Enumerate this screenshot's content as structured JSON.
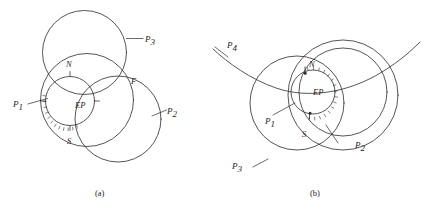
{
  "figure": {
    "background": "#ffffff",
    "ink_color": "#2b2b2b",
    "panels": [
      {
        "id": "a",
        "caption": "(a)",
        "labels": {
          "p1": "P",
          "p1_sub": "1",
          "p2": "P",
          "p2_sub": "2",
          "p3": "P",
          "p3_sub": "3",
          "north": "N",
          "south": "S",
          "focus": "F",
          "ep": "EP"
        },
        "description": "Three intersecting circles P1, P2, P3 with a small hatched exit-pupil circle EP at the center; N marks the north tick, S the south tick, F the upper intersection point."
      },
      {
        "id": "b",
        "caption": "(b)",
        "labels": {
          "p1": "P",
          "p1_sub": "1",
          "p2": "P",
          "p2_sub": "2",
          "p3": "P",
          "p3_sub": "3",
          "p4": "P",
          "p4_sub": "4",
          "north": "N",
          "south": "S",
          "ep": "EP"
        },
        "description": "Circles P1, P2, P3 plus a large sweeping arc P4; the small hatched exit-pupil circle EP sits between the nodes N and S."
      }
    ]
  }
}
